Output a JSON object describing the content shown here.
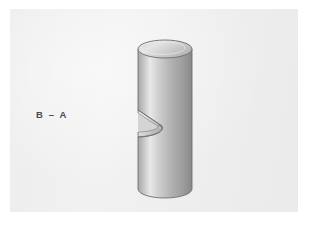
{
  "figure": {
    "kind": "technical-illustration",
    "section_label": "B – A",
    "background_color": "#f1f1f1",
    "page_color": "#ffffff",
    "outline_color": "#6f6f6f",
    "label_color": "#4b4b4b"
  },
  "panel": {
    "x": 10,
    "y": 9,
    "width": 288,
    "height": 203
  },
  "geometry": {
    "cylinder": {
      "center_x": 165,
      "left_x": 138,
      "right_x": 192,
      "top_y": 49,
      "bottom_y": 189,
      "radius_x": 27,
      "radius_y": 9,
      "top_face_color_light": "#e2e2e2",
      "top_face_color_dark": "#b9b9b9"
    },
    "notch": {
      "top_y": 110,
      "bottom_y": 137,
      "depth_x": 28,
      "cut_face_color_light": "#e6e6e6",
      "cut_face_color_dark": "#a9a9a9"
    },
    "body_shading": {
      "stops": [
        {
          "offset": 0.0,
          "color": "#8d8d8d"
        },
        {
          "offset": 0.1,
          "color": "#b2b2b2"
        },
        {
          "offset": 0.26,
          "color": "#e8e8e8"
        },
        {
          "offset": 0.38,
          "color": "#d2d2d2"
        },
        {
          "offset": 0.58,
          "color": "#b4b4b4"
        },
        {
          "offset": 0.8,
          "color": "#9b9b9b"
        },
        {
          "offset": 1.0,
          "color": "#7f7f7f"
        }
      ]
    }
  }
}
